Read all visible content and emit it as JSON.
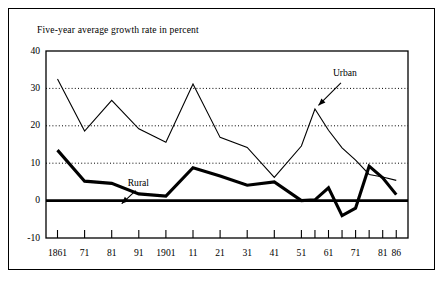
{
  "figure": {
    "title": "Five-year average growth rate in percent",
    "background_color": "#ffffff",
    "line_color": "#000000"
  },
  "chart_data": {
    "type": "line",
    "title": "Five-year average growth rate in percent",
    "xlabel": "",
    "ylabel": "",
    "ylim": [
      -10,
      40
    ],
    "yticks": [
      -10,
      0,
      10,
      20,
      30,
      40
    ],
    "ytick_labels": [
      "-10",
      "0",
      "10",
      "20",
      "30",
      "40"
    ],
    "gridlines": {
      "y_dotted_at": [
        10,
        20,
        30
      ],
      "zero_line": 0
    },
    "grid": true,
    "legend_position": "inline-annotations",
    "x": [
      1861,
      1871,
      1881,
      1891,
      1901,
      1911,
      1921,
      1931,
      1941,
      1951,
      1956,
      1961,
      1966,
      1971,
      1976,
      1981,
      1986
    ],
    "xtick_labels": [
      "1861",
      "71",
      "81",
      "91",
      "1901",
      "11",
      "21",
      "31",
      "41",
      "51",
      "61",
      "71",
      "81",
      "86"
    ],
    "xtick_label_values": [
      1861,
      1871,
      1881,
      1891,
      1901,
      1911,
      1921,
      1931,
      1941,
      1951,
      1961,
      1971,
      1981,
      1986
    ],
    "xtick_values": [
      1861,
      1871,
      1881,
      1891,
      1901,
      1911,
      1921,
      1931,
      1941,
      1951,
      1956,
      1961,
      1966,
      1971,
      1976,
      1981,
      1986
    ],
    "series": [
      {
        "name": "Urban",
        "style": "thin",
        "values": [
          32.5,
          18.6,
          26.8,
          19.2,
          15.6,
          31.2,
          16.9,
          14.2,
          6.2,
          14.6,
          24.5,
          18.8,
          14.1,
          10.8,
          7.0,
          6.3,
          5.4
        ]
      },
      {
        "name": "Rural",
        "style": "thick",
        "values": [
          13.5,
          5.2,
          4.6,
          1.8,
          1.2,
          8.8,
          6.6,
          4.1,
          5.0,
          0.0,
          0.2,
          3.4,
          -4.0,
          -2.0,
          9.2,
          6.1,
          1.6
        ]
      }
    ],
    "annotations": [
      {
        "text": "Urban",
        "points_to_x": 1956,
        "points_to_y": 24.5
      },
      {
        "text": "Rural",
        "points_to_x": 1886,
        "points_to_y": 4.0
      }
    ]
  },
  "axes": {
    "y_labels": [
      "40",
      "30",
      "20",
      "10",
      "0",
      "-10"
    ],
    "x_labels": [
      "1861",
      "71",
      "81",
      "91",
      "1901",
      "11",
      "21",
      "31",
      "41",
      "51",
      "61",
      "71",
      "81",
      "86"
    ]
  },
  "annotations": {
    "urban_label": "Urban",
    "rural_label": "Rural"
  }
}
